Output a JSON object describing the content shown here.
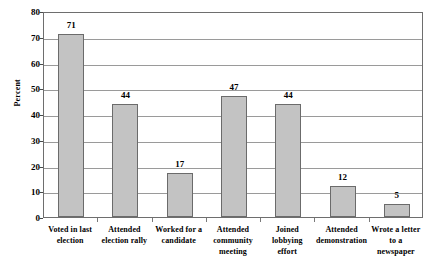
{
  "chart_data": {
    "type": "bar",
    "title": "",
    "subtitle": "",
    "xlabel": "",
    "ylabel": "Percent",
    "ylim": [
      0,
      80
    ],
    "ytick_step": 10,
    "yticks": [
      0,
      10,
      20,
      30,
      40,
      50,
      60,
      70,
      80
    ],
    "grid": true,
    "legend": false,
    "legend_position": "none",
    "categories": [
      "Voted in last election",
      "Attended election rally",
      "Worked for a candidate",
      "Attended community meeting",
      "Joined lobbying effort",
      "Attended demonstration",
      "Wrote a letter to a newspaper"
    ],
    "category_label_lines": [
      [
        "Voted in last",
        "election"
      ],
      [
        "Attended",
        "election rally"
      ],
      [
        "Worked for a",
        "candidate"
      ],
      [
        "Attended",
        "community",
        "meeting"
      ],
      [
        "Joined",
        "lobbying",
        "effort"
      ],
      [
        "Attended",
        "demonstration"
      ],
      [
        "Wrote a letter",
        "to a",
        "newspaper"
      ]
    ],
    "values": [
      71,
      44,
      17,
      47,
      44,
      12,
      5
    ],
    "value_labels": [
      "71",
      "44",
      "17",
      "47",
      "44",
      "12",
      "5"
    ],
    "bar_color": "#c3c3c3",
    "bar_border_color": "#6b6b6b",
    "gridline_color": "#9a9a9a",
    "frame_color": "#6e6e6e",
    "background_color": "#ffffff"
  }
}
